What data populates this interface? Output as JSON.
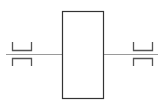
{
  "diagram": {
    "canvas": {
      "width": 161,
      "height": 107,
      "background": "#ffffff"
    },
    "colors": {
      "stroke": "#333333",
      "axis_line": "#9a9a9a",
      "bracket": "#555555"
    },
    "block": {
      "x": 62,
      "y": 11,
      "width": 41,
      "height": 87
    },
    "shaft": {
      "y": 54,
      "left_x1": 6,
      "left_x2": 62,
      "right_x1": 103,
      "right_x2": 158
    },
    "left_coupling": {
      "x1": 12,
      "x2": 31,
      "upper": {
        "y_top": 42,
        "y_bottom": 50
      },
      "lower": {
        "y_top": 58,
        "y_bottom": 66
      }
    },
    "right_coupling": {
      "x1": 133,
      "x2": 153,
      "upper": {
        "y_top": 42,
        "y_bottom": 50
      },
      "lower": {
        "y_top": 58,
        "y_bottom": 66
      }
    }
  }
}
